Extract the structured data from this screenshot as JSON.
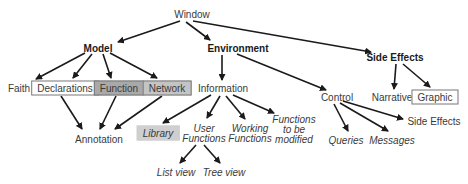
{
  "diagram": {
    "nodes": {
      "window": "Window",
      "model": "Model",
      "environment": "Environment",
      "side_effects": "Side Effects",
      "faith": "Faith",
      "declarations": "Declarations",
      "function": "Function",
      "network": "Network",
      "information": "Information",
      "control": "Control",
      "narrative": "Narrative",
      "graphic": "Graphic",
      "annotation": "Annotation",
      "library": "Library",
      "user_functions_1": "User",
      "user_functions_2": "Functions",
      "working_functions_1": "Working",
      "working_functions_2": "Functions",
      "functions_modified_1": "Functions",
      "functions_modified_2": "to be",
      "functions_modified_3": "modified",
      "queries": "Queries",
      "messages": "Messages",
      "control_side_effects": "Side Effects",
      "list_view": "List view",
      "tree_view": "Tree view"
    },
    "edges": [
      [
        "Window",
        "Model"
      ],
      [
        "Window",
        "Environment"
      ],
      [
        "Window",
        "Side Effects"
      ],
      [
        "Model",
        "Faith"
      ],
      [
        "Model",
        "Declarations"
      ],
      [
        "Model",
        "Function"
      ],
      [
        "Model",
        "Network"
      ],
      [
        "Declarations",
        "Annotation"
      ],
      [
        "Function",
        "Annotation"
      ],
      [
        "Network",
        "Annotation"
      ],
      [
        "Environment",
        "Information"
      ],
      [
        "Environment",
        "Control"
      ],
      [
        "Information",
        "Library"
      ],
      [
        "Information",
        "User Functions"
      ],
      [
        "Information",
        "Working Functions"
      ],
      [
        "Information",
        "Functions to be modified"
      ],
      [
        "User Functions",
        "List view"
      ],
      [
        "User Functions",
        "Tree view"
      ],
      [
        "Control",
        "Queries"
      ],
      [
        "Control",
        "Messages"
      ],
      [
        "Control",
        "Side Effects"
      ],
      [
        "Side Effects",
        "Narrative"
      ],
      [
        "Side Effects",
        "Graphic"
      ]
    ]
  }
}
